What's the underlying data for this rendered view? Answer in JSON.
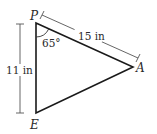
{
  "diagram": {
    "type": "triangle",
    "vertices": [
      {
        "name": "P",
        "x": 36,
        "y": 23
      },
      {
        "name": "A",
        "x": 133,
        "y": 67
      },
      {
        "name": "E",
        "x": 36,
        "y": 113
      }
    ],
    "angle_label": "65°",
    "side_PA_label": "15 in",
    "side_PE_label": "11 in",
    "line_color": "#1a1a1a",
    "dim_color": "#555555"
  }
}
